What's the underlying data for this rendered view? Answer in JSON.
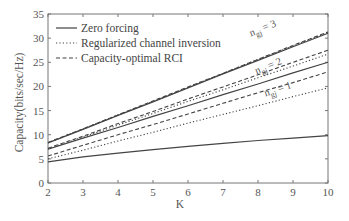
{
  "chart_data": {
    "type": "line",
    "title": "",
    "xlabel": "K",
    "ylabel": "Capacity(bits/sec/Hz)",
    "xlim": [
      2,
      10
    ],
    "ylim": [
      0,
      35
    ],
    "xticks": [
      2,
      3,
      4,
      5,
      6,
      7,
      8,
      9,
      10
    ],
    "yticks": [
      0,
      5,
      10,
      15,
      20,
      25,
      30,
      35
    ],
    "grid": false,
    "legend_position": "top-left",
    "legend": [
      {
        "name": "Zero forcing",
        "style": "solid"
      },
      {
        "name": "Regularized channel inversion",
        "style": "dotted"
      },
      {
        "name": "Capacity-optimal RCI",
        "style": "dashed"
      }
    ],
    "x": [
      2,
      3,
      4,
      5,
      6,
      7,
      8,
      9,
      10
    ],
    "series": [
      {
        "name": "Zero forcing",
        "group": "n_gj = 3",
        "style": "solid",
        "values": [
          8.3,
          11.1,
          14.0,
          16.8,
          19.7,
          22.6,
          25.4,
          28.2,
          31.0
        ]
      },
      {
        "name": "Regularized channel inversion",
        "group": "n_gj = 3",
        "style": "dotted",
        "values": [
          8.3,
          11.2,
          14.1,
          16.9,
          19.8,
          22.7,
          25.6,
          28.4,
          31.2
        ]
      },
      {
        "name": "Capacity-optimal RCI",
        "group": "n_gj = 3",
        "style": "dashed",
        "values": [
          8.4,
          11.2,
          14.1,
          17.0,
          19.9,
          22.7,
          25.6,
          28.5,
          31.3
        ]
      },
      {
        "name": "Zero forcing",
        "group": "n_gj = 2",
        "style": "solid",
        "values": [
          7.0,
          9.3,
          11.5,
          13.8,
          16.0,
          18.3,
          20.5,
          22.8,
          25.0
        ]
      },
      {
        "name": "Regularized channel inversion",
        "group": "n_gj = 2",
        "style": "dotted",
        "values": [
          7.1,
          9.5,
          12.0,
          14.4,
          16.9,
          19.3,
          21.8,
          24.2,
          26.7
        ]
      },
      {
        "name": "Capacity-optimal RCI",
        "group": "n_gj = 2",
        "style": "dashed",
        "values": [
          7.2,
          9.7,
          12.3,
          14.8,
          17.4,
          19.9,
          22.4,
          25.0,
          27.5
        ]
      },
      {
        "name": "Zero forcing",
        "group": "n_gj = 1",
        "style": "solid",
        "values": [
          4.4,
          5.4,
          6.2,
          6.9,
          7.6,
          8.2,
          8.8,
          9.3,
          9.8
        ]
      },
      {
        "name": "Regularized channel inversion",
        "group": "n_gj = 1",
        "style": "dotted",
        "values": [
          5.0,
          6.8,
          8.7,
          10.5,
          12.4,
          14.2,
          16.0,
          17.9,
          19.7
        ]
      },
      {
        "name": "Capacity-optimal RCI",
        "group": "n_gj = 1",
        "style": "dashed",
        "values": [
          5.6,
          7.8,
          10.0,
          12.1,
          14.3,
          16.5,
          18.7,
          20.8,
          23.0
        ]
      }
    ],
    "annotations": [
      {
        "text_main": "n",
        "text_sub": "gj",
        "text_rest": " = 3",
        "near_series_group": "n_gj = 3",
        "x": 8.2
      },
      {
        "text_main": "n",
        "text_sub": "gj",
        "text_rest": " = 2",
        "near_series_group": "n_gj = 2",
        "x": 8.3
      },
      {
        "text_main": "n",
        "text_sub": "gj",
        "text_rest": " = 1",
        "near_series_group": "n_gj = 1",
        "x": 8.5
      }
    ]
  }
}
